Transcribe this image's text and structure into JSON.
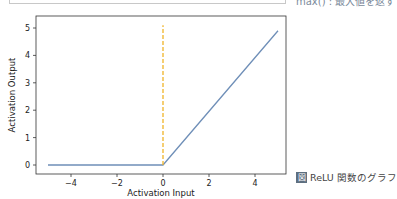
{
  "top_fragment": {
    "note_text": "max() : 最大値を返す"
  },
  "figure": {
    "caption_badge": "図",
    "caption_text": "ReLU 関数のグラフ"
  },
  "chart_data": {
    "type": "line",
    "title": "",
    "xlabel": "Activation Input",
    "ylabel": "Activation Output",
    "xlim": [
      -5.5,
      5.5
    ],
    "ylim": [
      -0.35,
      5.35
    ],
    "xticks": [
      -4,
      -2,
      0,
      2,
      4
    ],
    "yticks": [
      0,
      1,
      2,
      3,
      4,
      5
    ],
    "grid": false,
    "series": [
      {
        "name": "ReLU",
        "color": "#6f8fb8",
        "style": "solid",
        "x": [
          -5,
          0,
          5
        ],
        "y": [
          0,
          0,
          4.9
        ]
      },
      {
        "name": "x=0 marker",
        "color": "#f0b429",
        "style": "dashed",
        "x": [
          0,
          0
        ],
        "y": [
          0,
          5.1
        ]
      }
    ]
  }
}
